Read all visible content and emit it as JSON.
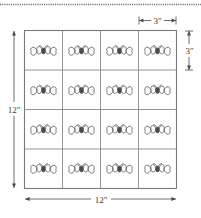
{
  "diagram": {
    "type": "grid-layout",
    "cut_line": {
      "name": "dotted-cut-line",
      "style": "dotted",
      "color": "#6b6b6b"
    },
    "grid": {
      "rows": 4,
      "columns": 4,
      "total_cells": 16,
      "line_color": "#8a8a8a",
      "border_color": "#7a7a7a",
      "fill_color": "#ffffff",
      "cell_motif": "butterfly-icon",
      "motif_color": "#5e5e5e"
    },
    "dimensions": {
      "overall_width": "12\"",
      "overall_height": "12\"",
      "cell_width": "3\"",
      "cell_height": "3\""
    },
    "labels": {
      "left": "12\"",
      "bottom": "12\"",
      "top_right": "3\"",
      "right": "3\""
    },
    "arrow_color": "#4a4a4a"
  }
}
